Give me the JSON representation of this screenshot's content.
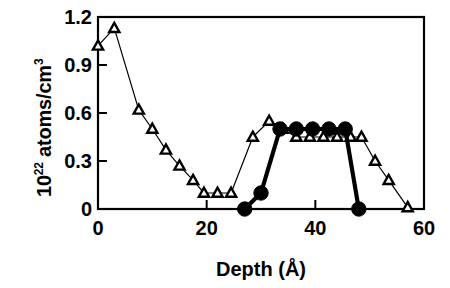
{
  "chart_data": {
    "type": "line",
    "title": "",
    "xlabel": "Depth (Å)",
    "ylabel": "10²² atoms/cm³",
    "ylabel_mantissa": "10",
    "ylabel_exponent": "22",
    "ylabel_rest": " atoms/cm",
    "ylabel_rest_exponent": "3",
    "xlim": [
      0,
      60
    ],
    "ylim": [
      0,
      1.2
    ],
    "xticks": [
      0,
      20,
      40,
      60
    ],
    "yticks": [
      0,
      0.3,
      0.6,
      0.9,
      1.2
    ],
    "xtick_labels": [
      "0",
      "20",
      "40",
      "60"
    ],
    "ytick_labels": [
      "0",
      "0.3",
      "0.6",
      "0.9",
      "1.2"
    ],
    "grid": false,
    "legend": "none",
    "frame": "box",
    "series": [
      {
        "name": "open-triangle-series",
        "marker": "triangle-open",
        "line_width": "thin",
        "color": "#000000",
        "points": [
          {
            "x": 0.0,
            "y": 1.02
          },
          {
            "x": 3.0,
            "y": 1.13
          },
          {
            "x": 7.5,
            "y": 0.62
          },
          {
            "x": 10.0,
            "y": 0.5
          },
          {
            "x": 12.5,
            "y": 0.37
          },
          {
            "x": 15.0,
            "y": 0.27
          },
          {
            "x": 17.5,
            "y": 0.18
          },
          {
            "x": 19.5,
            "y": 0.1
          },
          {
            "x": 22.0,
            "y": 0.1
          },
          {
            "x": 24.5,
            "y": 0.1
          },
          {
            "x": 28.5,
            "y": 0.45
          },
          {
            "x": 31.5,
            "y": 0.55
          },
          {
            "x": 34.0,
            "y": 0.5
          },
          {
            "x": 36.5,
            "y": 0.45
          },
          {
            "x": 39.0,
            "y": 0.45
          },
          {
            "x": 41.5,
            "y": 0.45
          },
          {
            "x": 44.0,
            "y": 0.45
          },
          {
            "x": 46.5,
            "y": 0.45
          },
          {
            "x": 48.5,
            "y": 0.45
          },
          {
            "x": 51.0,
            "y": 0.3
          },
          {
            "x": 53.5,
            "y": 0.18
          },
          {
            "x": 57.0,
            "y": 0.01
          }
        ]
      },
      {
        "name": "filled-circle-series",
        "marker": "circle-filled",
        "line_width": "thick",
        "color": "#000000",
        "points": [
          {
            "x": 27.0,
            "y": 0.0
          },
          {
            "x": 30.0,
            "y": 0.1
          },
          {
            "x": 33.5,
            "y": 0.5
          },
          {
            "x": 36.5,
            "y": 0.5
          },
          {
            "x": 39.5,
            "y": 0.5
          },
          {
            "x": 42.5,
            "y": 0.5
          },
          {
            "x": 45.5,
            "y": 0.5
          },
          {
            "x": 48.0,
            "y": 0.0
          }
        ]
      }
    ]
  }
}
